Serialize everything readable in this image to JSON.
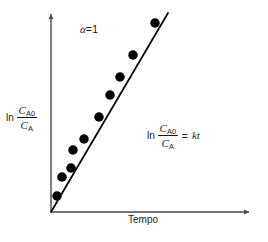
{
  "figure": {
    "background_color": "#ffffff",
    "ink_color": "#000000",
    "axis_color": "#4a4a4a"
  },
  "axes": {
    "x_label": "Tempo",
    "y_label_operator": "ln",
    "y_label_numerator": "C",
    "y_label_numerator_sub": "A0",
    "y_label_denominator": "C",
    "y_label_denominator_sub": "A"
  },
  "annotations": {
    "order_symbol": "α",
    "order_equals": "=",
    "order_value": "1",
    "rate_operator": "ln",
    "rate_numerator": "C",
    "rate_numerator_sub": "A0",
    "rate_denominator": "C",
    "rate_denominator_sub": "A",
    "rate_equals": "=",
    "rate_right_side": "kt"
  },
  "chart_data": {
    "type": "scatter",
    "title": "",
    "subtitle": "",
    "xlabel": "Tempo",
    "ylabel": "ln (C_A0 / C_A)",
    "grid": false,
    "legend": "none",
    "axis_ticks": false,
    "axis_tick_labels": false,
    "xlim": [
      0,
      1
    ],
    "ylim": [
      0,
      1
    ],
    "annotations": [
      "α = 1",
      "ln (C_A0 / C_A) = kt"
    ],
    "series": [
      {
        "name": "Dados experimentais",
        "type": "scatter",
        "marker": "filled-circle",
        "marker_color": "#000000",
        "marker_size_px": 9.5,
        "x": [
          0.03,
          0.055,
          0.099,
          0.109,
          0.163,
          0.238,
          0.292,
          0.342,
          0.406,
          0.515
        ],
        "y": [
          0.079,
          0.173,
          0.218,
          0.307,
          0.361,
          0.47,
          0.579,
          0.668,
          0.777,
          0.935
        ]
      },
      {
        "name": "Ajuste linear (ln C_A0/C_A = kt)",
        "type": "line",
        "line_color": "#000000",
        "x": [
          0.0,
          0.579
        ],
        "y": [
          0.0,
          0.985
        ]
      }
    ],
    "points_pixel": [
      {
        "cx": 57,
        "cy": 196
      },
      {
        "cx": 62,
        "cy": 177
      },
      {
        "cx": 71,
        "cy": 168
      },
      {
        "cx": 73,
        "cy": 150
      },
      {
        "cx": 84,
        "cy": 139
      },
      {
        "cx": 99,
        "cy": 117
      },
      {
        "cx": 110,
        "cy": 95
      },
      {
        "cx": 120,
        "cy": 77
      },
      {
        "cx": 133,
        "cy": 55
      },
      {
        "cx": 155,
        "cy": 23
      }
    ],
    "fit_line_pixel": {
      "x1": 51,
      "y1": 212,
      "x2": 168,
      "y2": 13
    },
    "axis_pixel": {
      "origin_x": 51,
      "origin_y": 212,
      "y_top": 10,
      "x_right": 253
    }
  }
}
